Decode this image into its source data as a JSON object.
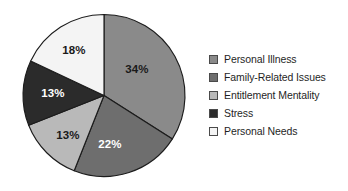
{
  "chart_data": {
    "type": "pie",
    "title": "",
    "subtitle": "",
    "xlabel": "",
    "ylabel": "",
    "grid": false,
    "legend_position": "right",
    "start_angle_deg": 0,
    "direction": "clockwise",
    "units": "percent",
    "categories": [
      "Personal Illness",
      "Family-Related Issues",
      "Entitlement Mentality",
      "Stress",
      "Personal Needs"
    ],
    "values": [
      34,
      22,
      13,
      13,
      18
    ],
    "value_labels": [
      "34%",
      "22%",
      "13%",
      "13%",
      "18%"
    ],
    "colors": [
      "#8a8a8a",
      "#6e6e6e",
      "#b9b9b9",
      "#2b2b2b",
      "#f4f4f4"
    ],
    "label_colors": [
      "#1a1a1a",
      "#ffffff",
      "#1a1a1a",
      "#ffffff",
      "#1a1a1a"
    ],
    "slices": [
      {
        "name": "Personal Illness",
        "value": 34,
        "label": "34%",
        "color": "#8a8a8a",
        "label_color": "#1a1a1a",
        "start_deg": 0,
        "end_deg": 122.4,
        "label_x": 137,
        "label_y": 70
      },
      {
        "name": "Family-Related Issues",
        "value": 22,
        "label": "22%",
        "color": "#6e6e6e",
        "label_color": "#ffffff",
        "start_deg": 122.4,
        "end_deg": 201.6,
        "label_x": 110,
        "label_y": 145
      },
      {
        "name": "Entitlement Mentality",
        "value": 13,
        "label": "13%",
        "color": "#b9b9b9",
        "label_color": "#1a1a1a",
        "start_deg": 201.6,
        "end_deg": 248.4,
        "label_x": 68,
        "label_y": 136
      },
      {
        "name": "Stress",
        "value": 13,
        "label": "13%",
        "color": "#2b2b2b",
        "label_color": "#ffffff",
        "start_deg": 248.4,
        "end_deg": 295.2,
        "label_x": 53,
        "label_y": 94
      },
      {
        "name": "Personal Needs",
        "value": 18,
        "label": "18%",
        "color": "#f4f4f4",
        "label_color": "#1a1a1a",
        "start_deg": 295.2,
        "end_deg": 360,
        "label_x": 74,
        "label_y": 51
      }
    ]
  },
  "legend": {
    "items": [
      {
        "label": "Personal Illness",
        "color": "#8a8a8a"
      },
      {
        "label": "Family-Related Issues",
        "color": "#6e6e6e"
      },
      {
        "label": "Entitlement Mentality",
        "color": "#b9b9b9"
      },
      {
        "label": "Stress",
        "color": "#2b2b2b"
      },
      {
        "label": "Personal Needs",
        "color": "#f4f4f4"
      }
    ]
  }
}
